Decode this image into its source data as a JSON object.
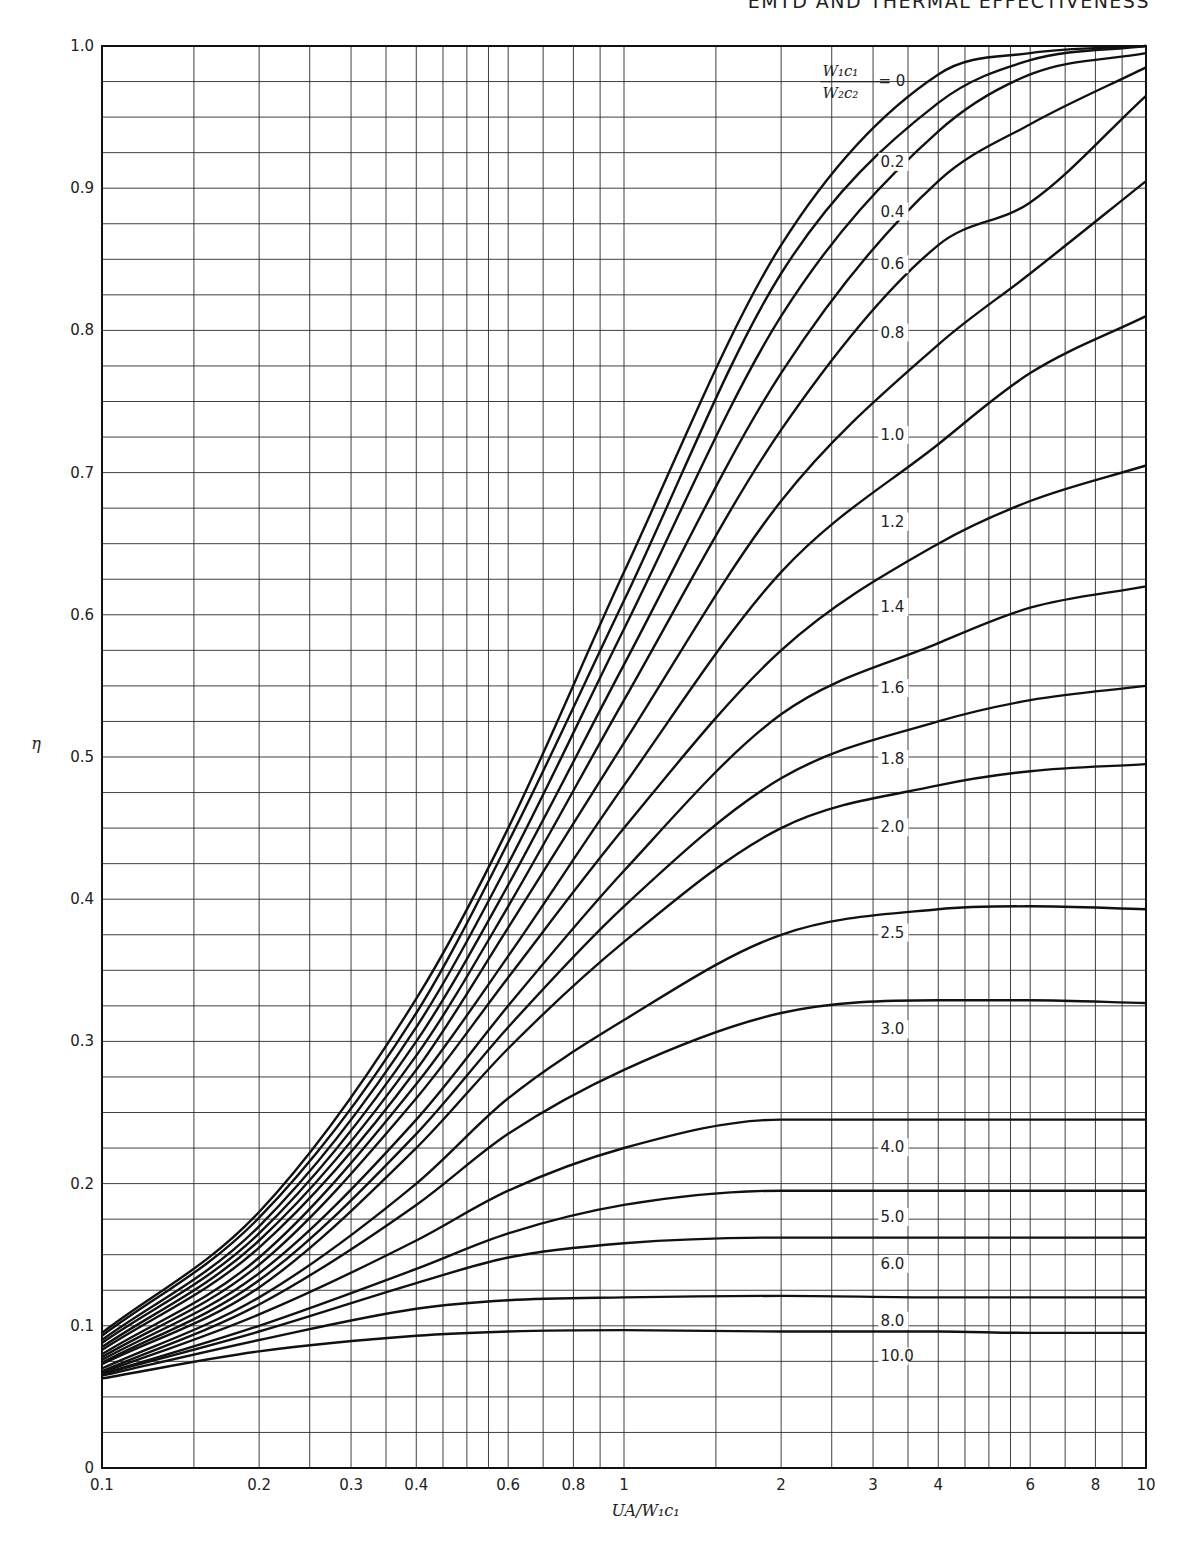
{
  "header": {
    "running_head": "EMTD AND THERMAL EFFECTIVENESS"
  },
  "legend": {
    "numerator": "W₁c₁",
    "denominator": "W₂c₂",
    "equals": "= 0"
  },
  "chart_data": {
    "type": "line",
    "title": "",
    "xlabel": "UA/W₁c₁",
    "ylabel": "η",
    "x_scale": "log",
    "xlim": [
      0.1,
      10
    ],
    "ylim": [
      0,
      1.0
    ],
    "grid": true,
    "x_ticks": [
      0.1,
      0.2,
      0.3,
      0.4,
      0.6,
      0.8,
      1,
      2,
      3,
      4,
      6,
      8,
      10
    ],
    "x_tick_labels": [
      "0.1",
      "0.2",
      "0.3",
      "0.4",
      "0.6",
      "0.8",
      "1",
      "2",
      "3",
      "4",
      "6",
      "8",
      "10"
    ],
    "x_grid": [
      0.1,
      0.15,
      0.2,
      0.25,
      0.3,
      0.35,
      0.4,
      0.45,
      0.5,
      0.55,
      0.6,
      0.7,
      0.8,
      0.9,
      1,
      1.5,
      2,
      2.5,
      3,
      3.5,
      4,
      4.5,
      5,
      5.5,
      6,
      7,
      8,
      9,
      10
    ],
    "y_ticks": [
      0,
      0.1,
      0.2,
      0.3,
      0.4,
      0.5,
      0.6,
      0.7,
      0.8,
      0.9,
      1.0
    ],
    "y_tick_labels": [
      "0",
      "0.1",
      "0.2",
      "0.3",
      "0.4",
      "0.5",
      "0.6",
      "0.7",
      "0.8",
      "0.9",
      "1.0"
    ],
    "y_grid_step": 0.025,
    "legend_title": "W₁c₁ / W₂c₂",
    "x": [
      0.1,
      0.2,
      0.4,
      0.6,
      1,
      2,
      4,
      6,
      10
    ],
    "series": [
      {
        "name": "0",
        "label_y": 0.975,
        "values": [
          0.095,
          0.18,
          0.33,
          0.45,
          0.63,
          0.86,
          0.98,
          0.995,
          1.0
        ]
      },
      {
        "name": "0.2",
        "label_y": 0.915,
        "values": [
          0.093,
          0.176,
          0.32,
          0.44,
          0.61,
          0.84,
          0.96,
          0.99,
          1.0
        ]
      },
      {
        "name": "0.4",
        "label_y": 0.88,
        "values": [
          0.09,
          0.17,
          0.31,
          0.425,
          0.59,
          0.81,
          0.94,
          0.98,
          0.995
        ]
      },
      {
        "name": "0.6",
        "label_y": 0.843,
        "values": [
          0.088,
          0.165,
          0.3,
          0.41,
          0.565,
          0.77,
          0.905,
          0.945,
          0.985
        ]
      },
      {
        "name": "0.8",
        "label_y": 0.795,
        "values": [
          0.085,
          0.16,
          0.29,
          0.395,
          0.54,
          0.73,
          0.86,
          0.89,
          0.965
        ]
      },
      {
        "name": "1.0",
        "label_y": 0.723,
        "values": [
          0.083,
          0.155,
          0.28,
          0.38,
          0.51,
          0.68,
          0.79,
          0.84,
          0.905
        ]
      },
      {
        "name": "1.2",
        "label_y": 0.662,
        "values": [
          0.08,
          0.148,
          0.27,
          0.36,
          0.48,
          0.63,
          0.72,
          0.77,
          0.81
        ]
      },
      {
        "name": "1.4",
        "label_y": 0.602,
        "values": [
          0.078,
          0.143,
          0.26,
          0.345,
          0.45,
          0.575,
          0.65,
          0.68,
          0.705
        ]
      },
      {
        "name": "1.6",
        "label_y": 0.545,
        "values": [
          0.076,
          0.137,
          0.245,
          0.325,
          0.42,
          0.53,
          0.58,
          0.605,
          0.62
        ]
      },
      {
        "name": "1.8",
        "label_y": 0.495,
        "values": [
          0.074,
          0.132,
          0.235,
          0.31,
          0.395,
          0.485,
          0.525,
          0.54,
          0.55
        ]
      },
      {
        "name": "2.0",
        "label_y": 0.447,
        "values": [
          0.073,
          0.127,
          0.225,
          0.295,
          0.37,
          0.45,
          0.48,
          0.49,
          0.495
        ]
      },
      {
        "name": "2.5",
        "label_y": 0.373,
        "values": [
          0.07,
          0.12,
          0.2,
          0.26,
          0.315,
          0.375,
          0.393,
          0.395,
          0.393
        ]
      },
      {
        "name": "3.0",
        "label_y": 0.305,
        "values": [
          0.068,
          0.115,
          0.185,
          0.235,
          0.28,
          0.32,
          0.329,
          0.329,
          0.327
        ]
      },
      {
        "name": "4.0",
        "label_y": 0.222,
        "values": [
          0.067,
          0.108,
          0.16,
          0.195,
          0.225,
          0.245,
          0.245,
          0.245,
          0.245
        ]
      },
      {
        "name": "5.0",
        "label_y": 0.173,
        "values": [
          0.066,
          0.1,
          0.14,
          0.165,
          0.185,
          0.195,
          0.195,
          0.195,
          0.195
        ]
      },
      {
        "name": "6.0",
        "label_y": 0.14,
        "values": [
          0.066,
          0.096,
          0.13,
          0.148,
          0.158,
          0.162,
          0.162,
          0.162,
          0.162
        ]
      },
      {
        "name": "8.0",
        "label_y": 0.1,
        "values": [
          0.065,
          0.09,
          0.112,
          0.118,
          0.12,
          0.121,
          0.12,
          0.12,
          0.12
        ]
      },
      {
        "name": "10.0",
        "label_y": 0.075,
        "values": [
          0.063,
          0.082,
          0.093,
          0.096,
          0.097,
          0.096,
          0.096,
          0.095,
          0.095
        ]
      }
    ],
    "label_x": 3.1,
    "colors": {
      "curve": "#111111",
      "grid": "#2a2a2a",
      "frame": "#111111",
      "background": "#ffffff"
    }
  }
}
